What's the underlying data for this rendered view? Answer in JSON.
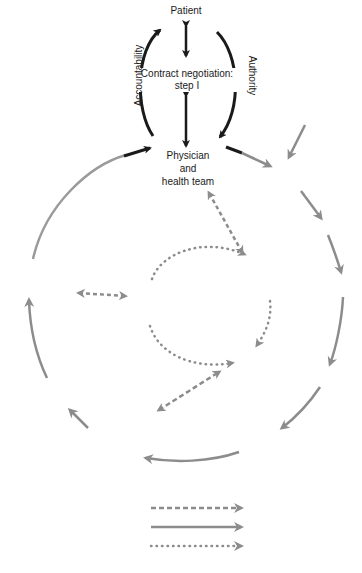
{
  "diagram": {
    "nodes": {
      "patient": "Patient",
      "contract_line1": "Contract negotiation:",
      "contract_line2": "step I",
      "physician_line1": "Physician",
      "physician_line2": "and",
      "physician_line3": "health team"
    },
    "side_labels": {
      "left": "Accountability",
      "right": "Authority"
    },
    "legend": {
      "items": [
        {
          "style": "dashed",
          "label": ""
        },
        {
          "style": "solid",
          "label": ""
        },
        {
          "style": "dotted",
          "label": ""
        }
      ]
    },
    "colors": {
      "black": "#1a1a1a",
      "gray": "#8c8c8c",
      "background": "#ffffff"
    }
  }
}
